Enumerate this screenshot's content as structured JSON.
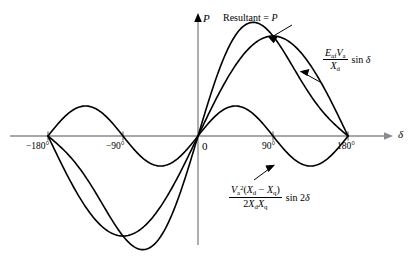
{
  "figure": {
    "title": "",
    "axes": {
      "x_label": "δ",
      "y_label": "P",
      "origin_label": "0",
      "x_ticks": [
        "−180°",
        "−90°",
        "90°",
        "180°"
      ],
      "x_tick_values": [
        -180,
        -90,
        90,
        180
      ]
    },
    "annotations": [
      {
        "name": "resultant-label",
        "text": "Resultant = P",
        "plain": "Resultant = P"
      },
      {
        "name": "excitation-power-label",
        "numerator": "EafVa",
        "denominator": "Xd",
        "trig": "sin δ"
      },
      {
        "name": "reluctance-power-label",
        "numerator": "Va²(Xd − Xq)",
        "denominator": "2XdXq",
        "trig": "sin 2δ"
      }
    ]
  },
  "chart_data": {
    "type": "line",
    "title": "",
    "xlabel": "δ",
    "ylabel": "P",
    "xlim": [
      -200,
      200
    ],
    "ylim": [
      -1.35,
      1.35
    ],
    "grid": false,
    "legend": "inline-annotations",
    "x_ticks": [
      -180,
      -90,
      0,
      90,
      180
    ],
    "x_tick_labels": [
      "−180°",
      "−90°",
      "0",
      "90°",
      "180°"
    ],
    "series": [
      {
        "name": "EafVa/Xd sin δ",
        "label": "(Eaf Va / Xd) sin δ",
        "formula": "A*sin(delta)",
        "amplitude": 1.0,
        "period_deg": 360,
        "peak_deg": 90,
        "peak_value": 1.0,
        "trough_deg": -90,
        "trough_value": -1.0,
        "zeros_deg": [
          -180,
          0,
          180
        ],
        "color": "#000000"
      },
      {
        "name": "Va^2(Xd-Xq)/(2XdXq) sin 2δ",
        "label": "(Va²(Xd − Xq) / (2 Xd Xq)) sin 2δ",
        "formula": "B*sin(2*delta)",
        "amplitude": 0.3,
        "period_deg": 180,
        "peak_deg": 45,
        "peak_value": 0.3,
        "trough_deg": 135,
        "trough_value": -0.3,
        "zeros_deg": [
          -180,
          -90,
          0,
          90,
          180
        ],
        "color": "#000000"
      },
      {
        "name": "Resultant = P",
        "label": "Resultant = P",
        "formula": "A*sin(delta) + B*sin(2*delta)",
        "amplitude": 1.0,
        "peak_deg": 72,
        "peak_value": 1.23,
        "trough_deg": -72,
        "trough_value": -1.23,
        "zeros_deg": [
          -180,
          0,
          180
        ],
        "color": "#000000"
      }
    ]
  },
  "style": {
    "axis_color": "#808080",
    "curve_color": "#000000",
    "background": "#ffffff"
  }
}
